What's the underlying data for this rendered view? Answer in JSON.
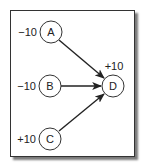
{
  "diagram": {
    "type": "directed-graph",
    "nodes": [
      {
        "id": "A",
        "label": "A",
        "value": "−10",
        "cx": 51,
        "cy": 32
      },
      {
        "id": "B",
        "label": "B",
        "value": "−10",
        "cx": 50,
        "cy": 86
      },
      {
        "id": "C",
        "label": "C",
        "value": "+10",
        "cx": 50,
        "cy": 139
      },
      {
        "id": "D",
        "label": "D",
        "value": "+10",
        "cx": 113,
        "cy": 86
      }
    ],
    "edges": [
      {
        "from": "A",
        "to": "D"
      },
      {
        "from": "B",
        "to": "D"
      },
      {
        "from": "C",
        "to": "D"
      }
    ],
    "colors": {
      "stroke": "#333333",
      "arrow": "#222222",
      "shadow": "#7a7a7a",
      "background": "#ffffff"
    }
  }
}
